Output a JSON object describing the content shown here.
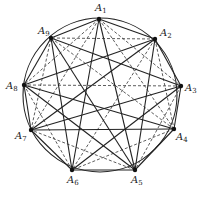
{
  "figure": {
    "caption": "",
    "circle": {
      "cx": 100,
      "cy": 95,
      "r": 77,
      "color": "#222222"
    },
    "points": [
      {
        "name": "A1",
        "x": 99,
        "y": 19,
        "lx": 95,
        "ly": 11
      },
      {
        "name": "A2",
        "x": 155,
        "y": 39,
        "lx": 160,
        "ly": 36
      },
      {
        "name": "A3",
        "x": 181,
        "y": 86,
        "lx": 185,
        "ly": 91
      },
      {
        "name": "A4",
        "x": 174,
        "y": 129,
        "lx": 176,
        "ly": 140
      },
      {
        "name": "A5",
        "x": 135,
        "y": 170,
        "lx": 131,
        "ly": 183
      },
      {
        "name": "A6",
        "x": 72,
        "y": 170,
        "lx": 67,
        "ly": 183
      },
      {
        "name": "A7",
        "x": 31,
        "y": 130,
        "lx": 15,
        "ly": 139
      },
      {
        "name": "A8",
        "x": 24,
        "y": 85,
        "lx": 6,
        "ly": 89
      },
      {
        "name": "A9",
        "x": 51,
        "y": 38,
        "lx": 38,
        "ly": 34
      }
    ],
    "solid_edges": [
      [
        1,
        2
      ],
      [
        2,
        3
      ],
      [
        3,
        4
      ],
      [
        4,
        5
      ],
      [
        5,
        6
      ],
      [
        6,
        7
      ],
      [
        7,
        8
      ],
      [
        8,
        9
      ],
      [
        9,
        1
      ],
      [
        1,
        5
      ],
      [
        1,
        6
      ],
      [
        2,
        5
      ],
      [
        2,
        7
      ],
      [
        2,
        8
      ],
      [
        3,
        6
      ],
      [
        3,
        7
      ],
      [
        3,
        9
      ],
      [
        4,
        7
      ],
      [
        4,
        8
      ],
      [
        5,
        8
      ],
      [
        5,
        9
      ],
      [
        6,
        9
      ]
    ],
    "dashed_color": "#333333"
  }
}
